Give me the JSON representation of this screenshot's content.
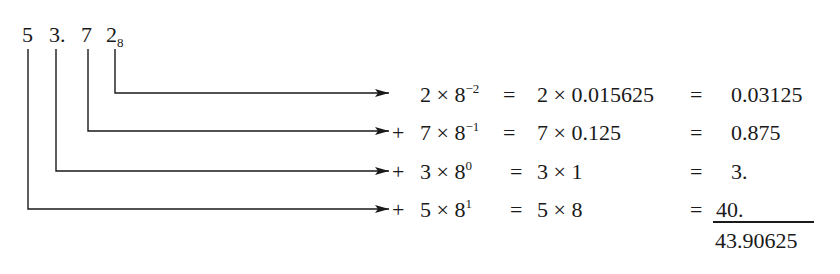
{
  "number": {
    "digits": [
      {
        "label": "5",
        "x": 22
      },
      {
        "label": "3.",
        "x": 49
      },
      {
        "label": "7",
        "x": 81
      },
      {
        "label": "2",
        "x": 106
      }
    ],
    "base_subscript": "8"
  },
  "rows": [
    {
      "prefix": "",
      "digit": "2",
      "times": "×",
      "base": "8",
      "exponent": "−2",
      "eq1": "=",
      "expansion": "2 × 0.015625",
      "eq2": "=",
      "value": "0.03125"
    },
    {
      "prefix": "+",
      "digit": "7",
      "times": "×",
      "base": "8",
      "exponent": "−1",
      "eq1": "=",
      "expansion": "7 × 0.125",
      "eq2": "=",
      "value": "0.875"
    },
    {
      "prefix": "+",
      "digit": "3",
      "times": "×",
      "base": "8",
      "exponent": "0",
      "eq1": "=",
      "expansion": "3 × 1",
      "eq2": "=",
      "value": "3."
    },
    {
      "prefix": "+",
      "digit": "5",
      "times": "×",
      "base": "8",
      "exponent": "1",
      "eq1": "=",
      "expansion": "5 × 8",
      "eq2": "=",
      "value": "40."
    }
  ],
  "total": "43.90625",
  "colors": {
    "ink": "#1a1a1a",
    "background": "#ffffff"
  }
}
